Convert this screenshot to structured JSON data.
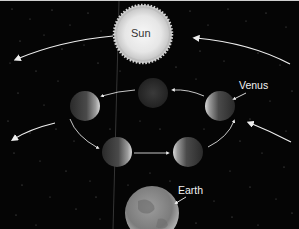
{
  "diagram": {
    "background_color": "#050505",
    "labels": {
      "sun": "Sun",
      "venus": "Venus",
      "earth": "Earth"
    },
    "bodies": {
      "sun": {
        "cx": 143,
        "cy": 33,
        "r": 25,
        "color": "#e9e9e9"
      },
      "earth": {
        "cx": 152,
        "cy": 212,
        "r": 27,
        "color": "#8a8a8a"
      },
      "venus_positions": [
        {
          "id": "top",
          "cx": 153,
          "cy": 92,
          "r": 15,
          "lit": "none"
        },
        {
          "id": "left",
          "cx": 85,
          "cy": 105,
          "r": 15,
          "lit": "right"
        },
        {
          "id": "right",
          "cx": 220,
          "cy": 105,
          "r": 15,
          "lit": "left"
        },
        {
          "id": "bottom-left",
          "cx": 117,
          "cy": 151,
          "r": 15,
          "lit": "right"
        },
        {
          "id": "bottom-right",
          "cx": 188,
          "cy": 151,
          "r": 15,
          "lit": "left"
        }
      ]
    },
    "colors": {
      "arrow": "#eeeeee",
      "sun_label": "#333333",
      "text_light": "#f2f2f2"
    }
  }
}
